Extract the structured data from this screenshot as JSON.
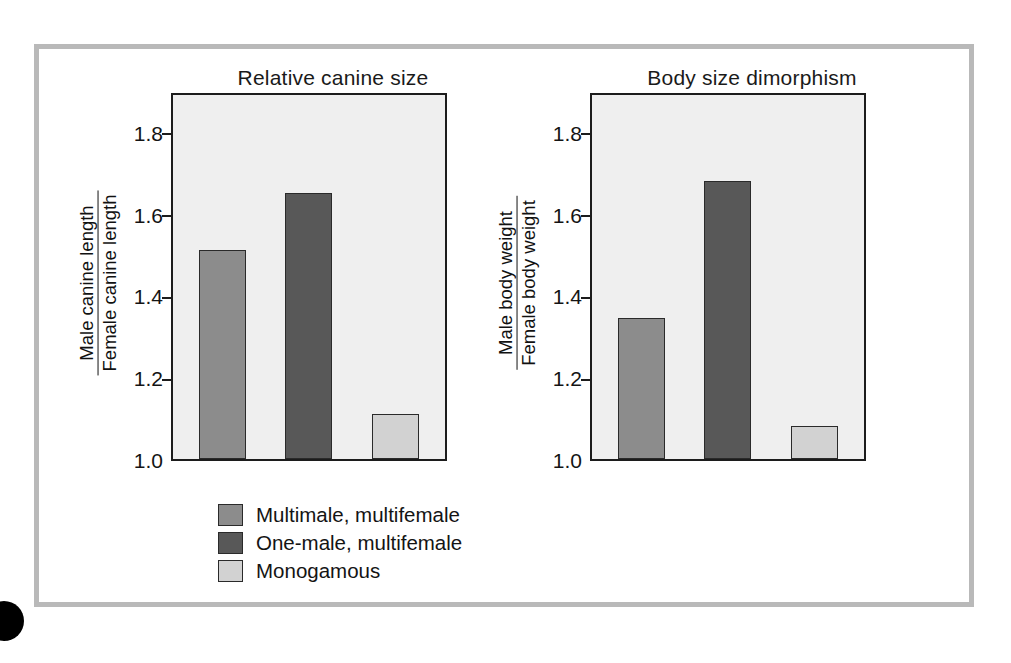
{
  "figure": {
    "background": "#ffffff",
    "frame_color": "#b9b9b9",
    "plot_background": "#efefef",
    "axis_color": "#1c1c1c"
  },
  "legend": {
    "items": [
      {
        "label": "Multimale, multifemale",
        "color": "#8c8c8c"
      },
      {
        "label": "One-male, multifemale",
        "color": "#585858"
      },
      {
        "label": "Monogamous",
        "color": "#d2d2d2"
      }
    ]
  },
  "chart_data": [
    {
      "type": "bar",
      "title": "Relative canine size",
      "xlabel": "",
      "ylabel": "Male canine length / Female canine length",
      "ylabel_numerator": "Male canine length",
      "ylabel_denominator": "Female canine length",
      "categories": [
        "Multimale, multifemale",
        "One-male, multifemale",
        "Monogamous"
      ],
      "values": [
        1.51,
        1.65,
        1.11
      ],
      "colors": [
        "#8c8c8c",
        "#585858",
        "#d2d2d2"
      ],
      "ylim": [
        1.0,
        1.9
      ],
      "yticks": [
        1.0,
        1.2,
        1.4,
        1.6,
        1.8
      ],
      "ytick_labels": [
        "1.0",
        "1.2",
        "1.4",
        "1.6",
        "1.8"
      ],
      "grid": false,
      "legend_position": "below"
    },
    {
      "type": "bar",
      "title": "Body size dimorphism",
      "xlabel": "",
      "ylabel": "Male body weight / Female body weight",
      "ylabel_numerator": "Male body weight",
      "ylabel_denominator": "Female body weight",
      "categories": [
        "Multimale, multifemale",
        "One-male, multifemale",
        "Monogamous"
      ],
      "values": [
        1.345,
        1.68,
        1.08
      ],
      "colors": [
        "#8c8c8c",
        "#585858",
        "#d2d2d2"
      ],
      "ylim": [
        1.0,
        1.9
      ],
      "yticks": [
        1.0,
        1.2,
        1.4,
        1.6,
        1.8
      ],
      "ytick_labels": [
        "1.0",
        "1.2",
        "1.4",
        "1.6",
        "1.8"
      ],
      "grid": false,
      "legend_position": "below"
    }
  ]
}
